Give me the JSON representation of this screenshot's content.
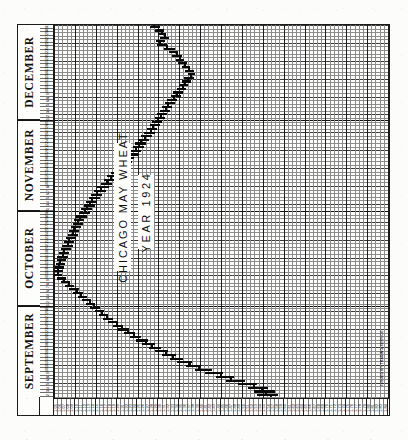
{
  "chart": {
    "title": "CHICAGO MAY WHEAT",
    "subtitle": "YEAR 1924",
    "credit": "ISSUED BY TRADING SERVICE"
  },
  "months": [
    {
      "name": "DECEMBER",
      "days": 31
    },
    {
      "name": "NOVEMBER",
      "days": 30
    },
    {
      "name": "OCTOBER",
      "days": 31
    },
    {
      "name": "SEPTEMBER",
      "days": 30
    }
  ],
  "day_labels": [
    "31",
    "30",
    "29",
    "27",
    "26",
    "25",
    "24",
    "23",
    "22",
    "20",
    "19",
    "18",
    "17",
    "16",
    "15",
    "13",
    "12",
    "11",
    "10",
    "9",
    "8",
    "6",
    "5",
    "4",
    "3",
    "2",
    "1",
    "29",
    "28",
    "27",
    "26",
    "25",
    "24",
    "22",
    "21",
    "20",
    "19",
    "18",
    "17",
    "15",
    "14",
    "13",
    "12",
    "11",
    "10",
    "8",
    "7",
    "6",
    "5",
    "4",
    "3",
    "1",
    "31",
    "30",
    "29",
    "28",
    "27",
    "25",
    "24",
    "23",
    "22",
    "21",
    "20",
    "18",
    "17",
    "16",
    "15",
    "14",
    "13",
    "11",
    "10",
    "9",
    "8",
    "7",
    "6",
    "4",
    "3",
    "2",
    "1",
    "30",
    "29",
    "27",
    "26",
    "25",
    "24",
    "23",
    "22",
    "20",
    "19",
    "18",
    "17",
    "16",
    "15",
    "13",
    "12",
    "11",
    "10",
    "9",
    "8",
    "6",
    "5",
    "4",
    "3",
    "2"
  ],
  "price_labels": [
    "1.05",
    "1.06",
    "1.07",
    "1.08",
    "1.09",
    "1.10",
    "1.11",
    "1.12",
    "1.13",
    "1.14",
    "1.15",
    "1.16",
    "1.17",
    "1.18",
    "1.19",
    "1.20",
    "1.21",
    "1.22",
    "1.23",
    "1.24",
    "1.25",
    "1.26",
    "1.27",
    "1.28",
    "1.29",
    "1.30",
    "1.31",
    "1.32",
    "1.33",
    "1.34",
    "1.35",
    "1.36",
    "1.37",
    "1.38",
    "1.39",
    "1.40",
    "1.41",
    "1.42",
    "1.43",
    "1.44",
    "1.45",
    "1.46",
    "1.47",
    "1.48",
    "1.49",
    "1.50",
    "1.51",
    "1.52",
    "1.53",
    "1.54",
    "1.55",
    "1.56",
    "1.57",
    "1.58",
    "1.59",
    "1.60",
    "1.61",
    "1.62",
    "1.63",
    "1.64",
    "1.65",
    "1.66",
    "1.67",
    "1.68",
    "1.69",
    "1.70",
    "1.71",
    "1.72",
    "1.73",
    "1.74",
    "1.75",
    "1.76",
    "1.77",
    "1.78",
    "1.79",
    "1.80",
    "1.81",
    "1.82",
    "1.83",
    "1.84"
  ],
  "chart_data": {
    "type": "ohlc",
    "title": "CHICAGO MAY WHEAT",
    "subtitle": "YEAR 1924",
    "orientation": "rotated-90ccw",
    "xlabel": "Date (September - December 1924)",
    "ylabel": "Price (dollars per bushel)",
    "ylim": [
      1.05,
      1.84
    ],
    "grid": true,
    "legend": false,
    "note": "Vintage price-range chart. Date axis runs vertically (Sept at bottom, Dec at top); price axis runs horizontally, increasing left to right. Each entry is one trading session: open, high, low, close.",
    "bars": [
      {
        "date": "Sep 2",
        "open": 1.285,
        "high": 1.3,
        "low": 1.278,
        "close": 1.295
      },
      {
        "date": "Sep 3",
        "open": 1.295,
        "high": 1.31,
        "low": 1.288,
        "close": 1.302
      },
      {
        "date": "Sep 4",
        "open": 1.302,
        "high": 1.316,
        "low": 1.296,
        "close": 1.31
      },
      {
        "date": "Sep 5",
        "open": 1.31,
        "high": 1.322,
        "low": 1.3,
        "close": 1.304
      },
      {
        "date": "Sep 6",
        "open": 1.304,
        "high": 1.312,
        "low": 1.292,
        "close": 1.298
      },
      {
        "date": "Sep 8",
        "open": 1.298,
        "high": 1.318,
        "low": 1.294,
        "close": 1.314
      },
      {
        "date": "Sep 9",
        "open": 1.314,
        "high": 1.336,
        "low": 1.31,
        "close": 1.33
      },
      {
        "date": "Sep 10",
        "open": 1.33,
        "high": 1.344,
        "low": 1.322,
        "close": 1.338
      },
      {
        "date": "Sep 11",
        "open": 1.338,
        "high": 1.352,
        "low": 1.33,
        "close": 1.346
      },
      {
        "date": "Sep 12",
        "open": 1.346,
        "high": 1.358,
        "low": 1.338,
        "close": 1.35
      },
      {
        "date": "Sep 13",
        "open": 1.35,
        "high": 1.364,
        "low": 1.344,
        "close": 1.358
      },
      {
        "date": "Sep 15",
        "open": 1.358,
        "high": 1.372,
        "low": 1.352,
        "close": 1.366
      },
      {
        "date": "Sep 16",
        "open": 1.366,
        "high": 1.38,
        "low": 1.36,
        "close": 1.374
      },
      {
        "date": "Sep 17",
        "open": 1.374,
        "high": 1.384,
        "low": 1.366,
        "close": 1.372
      },
      {
        "date": "Sep 18",
        "open": 1.372,
        "high": 1.382,
        "low": 1.358,
        "close": 1.364
      },
      {
        "date": "Sep 19",
        "open": 1.364,
        "high": 1.374,
        "low": 1.352,
        "close": 1.358
      },
      {
        "date": "Sep 20",
        "open": 1.358,
        "high": 1.368,
        "low": 1.346,
        "close": 1.352
      },
      {
        "date": "Sep 22",
        "open": 1.352,
        "high": 1.362,
        "low": 1.34,
        "close": 1.346
      },
      {
        "date": "Sep 23",
        "open": 1.346,
        "high": 1.356,
        "low": 1.332,
        "close": 1.338
      },
      {
        "date": "Sep 24",
        "open": 1.338,
        "high": 1.35,
        "low": 1.326,
        "close": 1.332
      },
      {
        "date": "Sep 25",
        "open": 1.332,
        "high": 1.342,
        "low": 1.318,
        "close": 1.324
      },
      {
        "date": "Sep 26",
        "open": 1.324,
        "high": 1.336,
        "low": 1.312,
        "close": 1.318
      },
      {
        "date": "Sep 27",
        "open": 1.318,
        "high": 1.33,
        "low": 1.306,
        "close": 1.312
      },
      {
        "date": "Sep 29",
        "open": 1.312,
        "high": 1.324,
        "low": 1.3,
        "close": 1.306
      },
      {
        "date": "Sep 30",
        "open": 1.306,
        "high": 1.318,
        "low": 1.294,
        "close": 1.3
      },
      {
        "date": "Oct 1",
        "open": 1.3,
        "high": 1.312,
        "low": 1.288,
        "close": 1.294
      },
      {
        "date": "Oct 2",
        "open": 1.294,
        "high": 1.306,
        "low": 1.282,
        "close": 1.288
      },
      {
        "date": "Oct 3",
        "open": 1.288,
        "high": 1.3,
        "low": 1.276,
        "close": 1.282
      },
      {
        "date": "Oct 4",
        "open": 1.282,
        "high": 1.294,
        "low": 1.27,
        "close": 1.276
      },
      {
        "date": "Oct 6",
        "open": 1.276,
        "high": 1.288,
        "low": 1.264,
        "close": 1.27
      },
      {
        "date": "Oct 7",
        "open": 1.27,
        "high": 1.282,
        "low": 1.256,
        "close": 1.262
      },
      {
        "date": "Oct 8",
        "open": 1.262,
        "high": 1.274,
        "low": 1.248,
        "close": 1.254
      },
      {
        "date": "Oct 9",
        "open": 1.254,
        "high": 1.268,
        "low": 1.242,
        "close": 1.248
      },
      {
        "date": "Oct 10",
        "open": 1.248,
        "high": 1.262,
        "low": 1.236,
        "close": 1.242
      },
      {
        "date": "Oct 11",
        "open": 1.242,
        "high": 1.256,
        "low": 1.228,
        "close": 1.234
      },
      {
        "date": "Oct 13",
        "open": 1.234,
        "high": 1.248,
        "low": 1.22,
        "close": 1.226
      },
      {
        "date": "Oct 14",
        "open": 1.226,
        "high": 1.24,
        "low": 1.214,
        "close": 1.22
      },
      {
        "date": "Oct 15",
        "open": 1.22,
        "high": 1.234,
        "low": 1.206,
        "close": 1.212
      },
      {
        "date": "Oct 16",
        "open": 1.212,
        "high": 1.226,
        "low": 1.198,
        "close": 1.204
      },
      {
        "date": "Oct 17",
        "open": 1.204,
        "high": 1.22,
        "low": 1.192,
        "close": 1.198
      },
      {
        "date": "Oct 18",
        "open": 1.198,
        "high": 1.212,
        "low": 1.184,
        "close": 1.19
      },
      {
        "date": "Oct 20",
        "open": 1.19,
        "high": 1.204,
        "low": 1.176,
        "close": 1.182
      },
      {
        "date": "Oct 21",
        "open": 1.182,
        "high": 1.196,
        "low": 1.168,
        "close": 1.174
      },
      {
        "date": "Oct 22",
        "open": 1.174,
        "high": 1.188,
        "low": 1.16,
        "close": 1.166
      },
      {
        "date": "Oct 23",
        "open": 1.166,
        "high": 1.18,
        "low": 1.152,
        "close": 1.158
      },
      {
        "date": "Oct 24",
        "open": 1.158,
        "high": 1.172,
        "low": 1.144,
        "close": 1.15
      },
      {
        "date": "Oct 25",
        "open": 1.15,
        "high": 1.164,
        "low": 1.138,
        "close": 1.144
      },
      {
        "date": "Oct 27",
        "open": 1.144,
        "high": 1.158,
        "low": 1.132,
        "close": 1.138
      },
      {
        "date": "Oct 28",
        "open": 1.138,
        "high": 1.152,
        "low": 1.126,
        "close": 1.132
      },
      {
        "date": "Oct 29",
        "open": 1.132,
        "high": 1.146,
        "low": 1.12,
        "close": 1.126
      },
      {
        "date": "Oct 30",
        "open": 1.126,
        "high": 1.14,
        "low": 1.114,
        "close": 1.12
      },
      {
        "date": "Oct 31",
        "open": 1.12,
        "high": 1.134,
        "low": 1.108,
        "close": 1.114
      },
      {
        "date": "Nov 1",
        "open": 1.114,
        "high": 1.128,
        "low": 1.102,
        "close": 1.108
      },
      {
        "date": "Nov 3",
        "open": 1.108,
        "high": 1.122,
        "low": 1.098,
        "close": 1.104
      },
      {
        "date": "Nov 4",
        "open": 1.104,
        "high": 1.118,
        "low": 1.094,
        "close": 1.1
      },
      {
        "date": "Nov 5",
        "open": 1.1,
        "high": 1.114,
        "low": 1.09,
        "close": 1.096
      },
      {
        "date": "Nov 6",
        "open": 1.096,
        "high": 1.11,
        "low": 1.086,
        "close": 1.092
      },
      {
        "date": "Nov 7",
        "open": 1.092,
        "high": 1.106,
        "low": 1.082,
        "close": 1.088
      },
      {
        "date": "Nov 8",
        "open": 1.088,
        "high": 1.102,
        "low": 1.078,
        "close": 1.084
      },
      {
        "date": "Nov 10",
        "open": 1.084,
        "high": 1.098,
        "low": 1.074,
        "close": 1.08
      },
      {
        "date": "Nov 11",
        "open": 1.08,
        "high": 1.094,
        "low": 1.07,
        "close": 1.076
      },
      {
        "date": "Nov 12",
        "open": 1.076,
        "high": 1.09,
        "low": 1.066,
        "close": 1.072
      },
      {
        "date": "Nov 13",
        "open": 1.072,
        "high": 1.086,
        "low": 1.062,
        "close": 1.068
      },
      {
        "date": "Nov 14",
        "open": 1.068,
        "high": 1.082,
        "low": 1.058,
        "close": 1.064
      },
      {
        "date": "Nov 15",
        "open": 1.064,
        "high": 1.078,
        "low": 1.056,
        "close": 1.062
      },
      {
        "date": "Nov 17",
        "open": 1.062,
        "high": 1.076,
        "low": 1.054,
        "close": 1.06
      },
      {
        "date": "Nov 18",
        "open": 1.06,
        "high": 1.074,
        "low": 1.052,
        "close": 1.058
      },
      {
        "date": "Nov 19",
        "open": 1.058,
        "high": 1.072,
        "low": 1.05,
        "close": 1.056
      },
      {
        "date": "Nov 20",
        "open": 1.056,
        "high": 1.07,
        "low": 1.05,
        "close": 1.062
      },
      {
        "date": "Nov 21",
        "open": 1.062,
        "high": 1.078,
        "low": 1.056,
        "close": 1.072
      },
      {
        "date": "Nov 22",
        "open": 1.072,
        "high": 1.088,
        "low": 1.066,
        "close": 1.082
      },
      {
        "date": "Nov 24",
        "open": 1.082,
        "high": 1.098,
        "low": 1.076,
        "close": 1.092
      },
      {
        "date": "Nov 25",
        "open": 1.092,
        "high": 1.108,
        "low": 1.086,
        "close": 1.102
      },
      {
        "date": "Nov 26",
        "open": 1.102,
        "high": 1.118,
        "low": 1.096,
        "close": 1.112
      },
      {
        "date": "Nov 28",
        "open": 1.112,
        "high": 1.128,
        "low": 1.106,
        "close": 1.122
      },
      {
        "date": "Nov 29",
        "open": 1.122,
        "high": 1.138,
        "low": 1.116,
        "close": 1.132
      },
      {
        "date": "Dec 1",
        "open": 1.132,
        "high": 1.148,
        "low": 1.126,
        "close": 1.142
      },
      {
        "date": "Dec 2",
        "open": 1.142,
        "high": 1.158,
        "low": 1.136,
        "close": 1.152
      },
      {
        "date": "Dec 3",
        "open": 1.152,
        "high": 1.168,
        "low": 1.146,
        "close": 1.162
      },
      {
        "date": "Dec 4",
        "open": 1.162,
        "high": 1.178,
        "low": 1.156,
        "close": 1.172
      },
      {
        "date": "Dec 5",
        "open": 1.172,
        "high": 1.19,
        "low": 1.166,
        "close": 1.184
      },
      {
        "date": "Dec 6",
        "open": 1.184,
        "high": 1.202,
        "low": 1.178,
        "close": 1.196
      },
      {
        "date": "Dec 8",
        "open": 1.196,
        "high": 1.214,
        "low": 1.19,
        "close": 1.208
      },
      {
        "date": "Dec 9",
        "open": 1.208,
        "high": 1.228,
        "low": 1.202,
        "close": 1.222
      },
      {
        "date": "Dec 10",
        "open": 1.222,
        "high": 1.242,
        "low": 1.216,
        "close": 1.236
      },
      {
        "date": "Dec 11",
        "open": 1.236,
        "high": 1.256,
        "low": 1.23,
        "close": 1.25
      },
      {
        "date": "Dec 12",
        "open": 1.25,
        "high": 1.272,
        "low": 1.244,
        "close": 1.266
      },
      {
        "date": "Dec 13",
        "open": 1.266,
        "high": 1.288,
        "low": 1.258,
        "close": 1.28
      },
      {
        "date": "Dec 15",
        "open": 1.28,
        "high": 1.304,
        "low": 1.274,
        "close": 1.296
      },
      {
        "date": "Dec 16",
        "open": 1.296,
        "high": 1.32,
        "low": 1.29,
        "close": 1.312
      },
      {
        "date": "Dec 17",
        "open": 1.312,
        "high": 1.338,
        "low": 1.306,
        "close": 1.33
      },
      {
        "date": "Dec 18",
        "open": 1.33,
        "high": 1.356,
        "low": 1.324,
        "close": 1.348
      },
      {
        "date": "Dec 19",
        "open": 1.348,
        "high": 1.376,
        "low": 1.342,
        "close": 1.368
      },
      {
        "date": "Dec 20",
        "open": 1.368,
        "high": 1.398,
        "low": 1.362,
        "close": 1.39
      },
      {
        "date": "Dec 22",
        "open": 1.39,
        "high": 1.424,
        "low": 1.384,
        "close": 1.416
      },
      {
        "date": "Dec 23",
        "open": 1.416,
        "high": 1.45,
        "low": 1.408,
        "close": 1.442
      },
      {
        "date": "Dec 24",
        "open": 1.442,
        "high": 1.476,
        "low": 1.434,
        "close": 1.466
      },
      {
        "date": "Dec 26",
        "open": 1.466,
        "high": 1.502,
        "low": 1.458,
        "close": 1.494
      },
      {
        "date": "Dec 27",
        "open": 1.494,
        "high": 1.53,
        "low": 1.486,
        "close": 1.52
      },
      {
        "date": "Dec 29",
        "open": 1.52,
        "high": 1.556,
        "low": 1.508,
        "close": 1.54
      },
      {
        "date": "Dec 30",
        "open": 1.54,
        "high": 1.572,
        "low": 1.522,
        "close": 1.548
      },
      {
        "date": "Dec 31",
        "open": 1.548,
        "high": 1.58,
        "low": 1.53,
        "close": 1.56
      }
    ]
  }
}
